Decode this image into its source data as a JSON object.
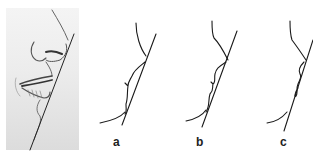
{
  "figure": {
    "sketch": {
      "subject": "pencil sketch of nose, lips and chin in profile with straight reference line"
    },
    "profiles": [
      {
        "label": "a"
      },
      {
        "label": "b"
      },
      {
        "label": "c"
      }
    ],
    "colors": {
      "line": "#1a1a1a",
      "sketch_bg": "#e8e8e8",
      "background": "#ffffff"
    }
  }
}
